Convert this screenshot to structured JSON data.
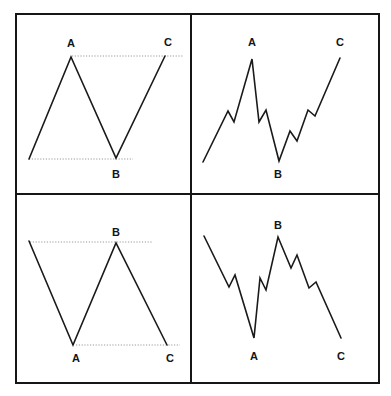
{
  "figure": {
    "colors": {
      "line": "#1a1a1a",
      "frame": "#161616",
      "guide": "#9a9a9a",
      "background": "#ffffff"
    },
    "frame": {
      "x": 16,
      "y": 14,
      "width": 363,
      "height": 369,
      "divider_x": 191,
      "divider_y": 194
    },
    "panels": [
      {
        "id": "top-left",
        "style": "simple",
        "points": "29,159 71,57 116,158 165,56",
        "guides": [
          {
            "x1": 72,
            "y1": 56,
            "x2": 183,
            "y2": 56
          },
          {
            "x1": 29,
            "y1": 159,
            "x2": 133,
            "y2": 159
          }
        ],
        "labels": [
          {
            "text": "A",
            "x": 71,
            "y": 47
          },
          {
            "text": "C",
            "x": 168,
            "y": 46
          },
          {
            "text": "B",
            "x": 116,
            "y": 178
          }
        ]
      },
      {
        "id": "top-right",
        "style": "detailed",
        "points": "203,162 228,111 234,122 252,59 259,122 266,110 279,161 290,131 297,141 308,110 315,116 340,58",
        "guides": [],
        "labels": [
          {
            "text": "A",
            "x": 252,
            "y": 46
          },
          {
            "text": "C",
            "x": 340,
            "y": 46
          },
          {
            "text": "B",
            "x": 278,
            "y": 178
          }
        ]
      },
      {
        "id": "bottom-left",
        "style": "simple",
        "points": "29,241 73,345 116,243 167,345",
        "guides": [
          {
            "x1": 30,
            "y1": 242,
            "x2": 153,
            "y2": 242
          },
          {
            "x1": 76,
            "y1": 345,
            "x2": 180,
            "y2": 345
          }
        ],
        "labels": [
          {
            "text": "B",
            "x": 116,
            "y": 236
          },
          {
            "text": "A",
            "x": 76,
            "y": 362
          },
          {
            "text": "C",
            "x": 170,
            "y": 362
          }
        ]
      },
      {
        "id": "bottom-right",
        "style": "detailed",
        "points": "204,236 229,287 235,275 254,338 260,278 266,290 278,237 291,268 297,255 309,288 316,282 341,338",
        "guides": [],
        "labels": [
          {
            "text": "B",
            "x": 278,
            "y": 229
          },
          {
            "text": "A",
            "x": 254,
            "y": 360
          },
          {
            "text": "C",
            "x": 341,
            "y": 360
          }
        ]
      }
    ]
  }
}
